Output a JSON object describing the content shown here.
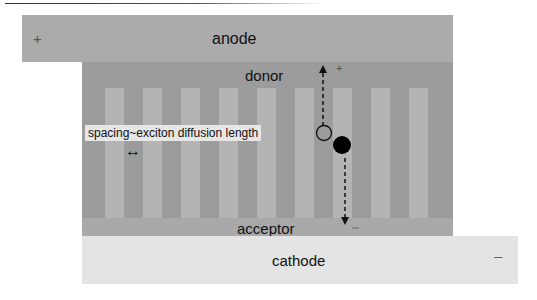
{
  "diagram": {
    "layers": {
      "anode": {
        "label": "anode",
        "sign": "+",
        "color": "#ababab"
      },
      "donor": {
        "label": "donor",
        "color": "#9c9c9c"
      },
      "acceptor": {
        "label": "acceptor",
        "color": "#a9a9a9",
        "stripe_color": "#b4b4b4"
      },
      "cathode": {
        "label": "cathode",
        "sign": "–",
        "color": "#e4e4e4"
      }
    },
    "annotation": {
      "text": "spacing~exciton diffusion length",
      "arrow_glyph": "↔"
    },
    "carriers": {
      "hole": {
        "type": "open-circle",
        "direction": "up",
        "sign": "+"
      },
      "electron": {
        "type": "filled-circle",
        "direction": "down",
        "sign": "–"
      }
    },
    "stripes_x": [
      105,
      143,
      181,
      219,
      257,
      295,
      333,
      371,
      409
    ]
  }
}
